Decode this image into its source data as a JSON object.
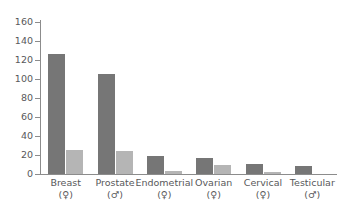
{
  "chart_data": {
    "type": "bar",
    "title": "",
    "subtitle": "",
    "xlabel": "",
    "ylabel": "",
    "ylim": [
      0,
      160
    ],
    "yticks": [
      0,
      20,
      40,
      60,
      80,
      100,
      120,
      140,
      160
    ],
    "ytick_labels": [
      "0",
      "20",
      "40",
      "60",
      "80",
      "100",
      "120",
      "140",
      "160"
    ],
    "grid": false,
    "legend": null,
    "legend_position": "none",
    "categories": [
      "Breast",
      "Prostate",
      "Endometrial",
      "Ovarian",
      "Cervical",
      "Testicular"
    ],
    "category_sex_symbols": [
      "(♀)",
      "(♂)",
      "(♀)",
      "(♀)",
      "(♀)",
      "(♂)"
    ],
    "series": [
      {
        "name": "series-1",
        "color": "#767676",
        "values": [
          126,
          105,
          19,
          17,
          11,
          8
        ]
      },
      {
        "name": "series-2",
        "color": "#b5b5b5",
        "values": [
          25,
          24,
          3,
          9,
          2,
          0
        ]
      }
    ],
    "axis_color": "#8c8c8c",
    "text_color": "#58585a",
    "background": "#ffffff"
  }
}
